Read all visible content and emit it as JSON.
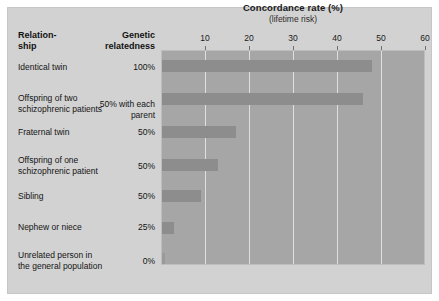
{
  "chart_data": {
    "type": "bar",
    "orientation": "horizontal",
    "title": "Concordance rate (%)",
    "subtitle": "(lifetime risk)",
    "xlabel": "",
    "ylabel": "",
    "xlim": [
      0,
      60
    ],
    "xticks": [
      10,
      20,
      30,
      40,
      50,
      60
    ],
    "grid": true,
    "legend": false,
    "categories": [
      "Identical twin",
      "Offspring of two schizophrenic patients",
      "Fraternal twin",
      "Offspring of one schizophrenic patient",
      "Sibling",
      "Nephew or niece",
      "Unrelated person in the general population"
    ],
    "values": [
      48,
      46,
      17,
      13,
      9,
      3,
      1
    ],
    "series": [
      {
        "name": "Concordance rate (%)",
        "values": [
          48,
          46,
          17,
          13,
          9,
          3,
          1
        ]
      }
    ]
  },
  "table": {
    "headers": {
      "relationship": "Relation-\nship",
      "relationship_line1": "Relation-",
      "relationship_line2": "ship",
      "genetic": "Genetic relatedness",
      "genetic_line1": "Genetic",
      "genetic_line2": "relatedness"
    },
    "rows": [
      {
        "label": "Identical twin",
        "relatedness": "100%",
        "value": 48
      },
      {
        "label": "Offspring of two schizophrenic patients",
        "relatedness": "50% with each parent",
        "value": 46
      },
      {
        "label": "Fraternal twin",
        "relatedness": "50%",
        "value": 17
      },
      {
        "label": "Offspring of one schizophrenic patient",
        "relatedness": "50%",
        "value": 13
      },
      {
        "label": "Sibling",
        "relatedness": "50%",
        "value": 9
      },
      {
        "label": "Nephew or niece",
        "relatedness": "25%",
        "value": 3
      },
      {
        "label": "Unrelated person in the general population",
        "relatedness": "0%",
        "value": 1
      }
    ]
  },
  "colors": {
    "panel_background": "#d2d2d2",
    "plot_background": "#a6a6a6",
    "bar": "#8d8d8d",
    "gridline": "#e8e8e8",
    "text": "#141414"
  }
}
